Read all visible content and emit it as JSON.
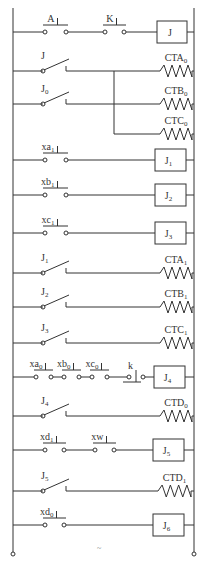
{
  "diagram": {
    "title": "",
    "rails": {
      "left_x": 13,
      "right_x": 194,
      "top_y": 8,
      "bottom_y": 552
    },
    "rungs": [
      {
        "id": "r1",
        "y": 32,
        "elements": [
          {
            "type": "no_pushbutton",
            "label": "A",
            "sub": "",
            "x1": 43,
            "x2": 68
          },
          {
            "type": "no_pushbutton",
            "label": "K",
            "sub": "",
            "x1": 103,
            "x2": 126
          },
          {
            "type": "relay_coil",
            "label": "J",
            "sub": "",
            "x1": 157,
            "x2": 187
          }
        ]
      },
      {
        "id": "r2",
        "y": 71,
        "elements": [
          {
            "type": "no_contact",
            "label": "J",
            "sub": "",
            "x1": 43,
            "x2": 66
          },
          {
            "type": "heater",
            "label": "CTA",
            "sub": "0",
            "x1": 160,
            "x2": 192
          }
        ]
      },
      {
        "id": "r3",
        "y": 104,
        "elements": [
          {
            "type": "no_contact",
            "label": "J",
            "sub": "0",
            "x1": 43,
            "x2": 66
          },
          {
            "type": "heater",
            "label": "CTB",
            "sub": "0",
            "x1": 160,
            "x2": 192
          }
        ]
      },
      {
        "id": "r3b",
        "y": 134,
        "branch_from_x": 114,
        "elements": [
          {
            "type": "heater",
            "label": "CTC",
            "sub": "0",
            "x1": 160,
            "x2": 192
          }
        ]
      },
      {
        "id": "r4",
        "y": 160,
        "elements": [
          {
            "type": "no_pushbutton",
            "label": "xa",
            "sub": "1",
            "x1": 43,
            "x2": 68
          },
          {
            "type": "relay_coil",
            "label": "J",
            "sub": "1",
            "x1": 155,
            "x2": 186
          }
        ]
      },
      {
        "id": "r5",
        "y": 195,
        "elements": [
          {
            "type": "no_pushbutton",
            "label": "xb",
            "sub": "1",
            "x1": 43,
            "x2": 68
          },
          {
            "type": "relay_coil",
            "label": "J",
            "sub": "2",
            "x1": 155,
            "x2": 186
          }
        ]
      },
      {
        "id": "r6",
        "y": 233,
        "elements": [
          {
            "type": "no_pushbutton",
            "label": "xc",
            "sub": "1",
            "x1": 43,
            "x2": 68
          },
          {
            "type": "relay_coil",
            "label": "J",
            "sub": "3",
            "x1": 155,
            "x2": 186
          }
        ]
      },
      {
        "id": "r7",
        "y": 273,
        "elements": [
          {
            "type": "no_contact",
            "label": "J",
            "sub": "1",
            "x1": 43,
            "x2": 66
          },
          {
            "type": "heater",
            "label": "CTA",
            "sub": "1",
            "x1": 160,
            "x2": 192
          }
        ]
      },
      {
        "id": "r8",
        "y": 307,
        "elements": [
          {
            "type": "no_contact",
            "label": "J",
            "sub": "2",
            "x1": 43,
            "x2": 66
          },
          {
            "type": "heater",
            "label": "CTB",
            "sub": "1",
            "x1": 160,
            "x2": 192
          }
        ]
      },
      {
        "id": "r9",
        "y": 343,
        "elements": [
          {
            "type": "no_contact",
            "label": "J",
            "sub": "3",
            "x1": 43,
            "x2": 66
          },
          {
            "type": "heater",
            "label": "CTC",
            "sub": "1",
            "x1": 160,
            "x2": 192
          }
        ]
      },
      {
        "id": "r10",
        "y": 377,
        "elements": [
          {
            "type": "no_pushbutton",
            "label": "xa",
            "sub": "0",
            "x1": 34,
            "x2": 53
          },
          {
            "type": "no_pushbutton",
            "label": "xb",
            "sub": "0",
            "x1": 62,
            "x2": 81
          },
          {
            "type": "no_pushbutton",
            "label": "xc",
            "sub": "0",
            "x1": 90,
            "x2": 109
          },
          {
            "type": "nc_pushbutton",
            "label": "k",
            "sub": "",
            "x1": 127,
            "x2": 145
          },
          {
            "type": "relay_coil",
            "label": "J",
            "sub": "4",
            "x1": 154,
            "x2": 185
          }
        ]
      },
      {
        "id": "r11",
        "y": 416,
        "elements": [
          {
            "type": "no_contact",
            "label": "J",
            "sub": "4",
            "x1": 43,
            "x2": 66
          },
          {
            "type": "heater",
            "label": "CTD",
            "sub": "0",
            "x1": 160,
            "x2": 192
          }
        ]
      },
      {
        "id": "r12",
        "y": 450,
        "elements": [
          {
            "type": "no_pushbutton",
            "label": "xd",
            "sub": "1",
            "x1": 43,
            "x2": 66
          },
          {
            "type": "no_pushbutton",
            "label": "xw",
            "sub": "",
            "x1": 93,
            "x2": 116
          },
          {
            "type": "relay_coil",
            "label": "J",
            "sub": "5",
            "x1": 153,
            "x2": 184
          }
        ]
      },
      {
        "id": "r13",
        "y": 491,
        "elements": [
          {
            "type": "no_contact",
            "label": "J",
            "sub": "5",
            "x1": 43,
            "x2": 66
          },
          {
            "type": "heater",
            "label": "CTD",
            "sub": "1",
            "x1": 158,
            "x2": 191
          }
        ]
      },
      {
        "id": "r14",
        "y": 525,
        "elements": [
          {
            "type": "no_pushbutton",
            "label": "xd",
            "sub": "0",
            "x1": 43,
            "x2": 66
          },
          {
            "type": "relay_coil",
            "label": "J",
            "sub": "6",
            "x1": 153,
            "x2": 184
          }
        ]
      }
    ],
    "footer_mark": "~"
  }
}
